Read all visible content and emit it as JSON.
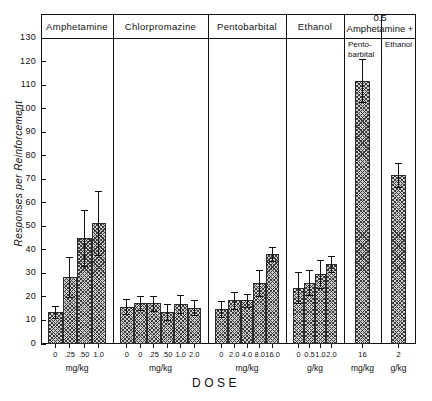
{
  "chart_data": {
    "type": "bar",
    "title": "",
    "xlabel": "DOSE",
    "ylabel": "Responses per Reinforcement",
    "ylim": [
      0,
      130
    ],
    "ytick_values": [
      0,
      10,
      20,
      30,
      40,
      50,
      60,
      70,
      80,
      90,
      100,
      110,
      120,
      130
    ],
    "ytick_labels": [
      "0",
      "10",
      "20",
      "30",
      "40",
      "50",
      "60",
      "70",
      "80",
      "90",
      "100",
      "110",
      "120",
      "130"
    ],
    "grid": false,
    "legend": "none",
    "error_bars": "vertical, symmetric, capped",
    "panels": [
      {
        "name": "amphetamine",
        "header": "Amphetamine",
        "units": "mg/kg",
        "categories": [
          "0",
          ".25",
          ".50",
          "1.0"
        ],
        "values": [
          13.5,
          28.5,
          45.0,
          51.5
        ],
        "errors": [
          2.5,
          8.5,
          12.0,
          13.5
        ]
      },
      {
        "name": "chlorpromazine",
        "header": "Chlorpromazine",
        "units": "mg/kg",
        "categories": [
          "0",
          "0",
          ".25",
          ".50",
          "1.0",
          "2.0"
        ],
        "values": [
          15.8,
          17.5,
          17.3,
          13.5,
          17.0,
          15.5
        ],
        "errors": [
          3.2,
          3.0,
          3.3,
          3.3,
          4.0,
          3.3
        ]
      },
      {
        "name": "pentobarbital",
        "header": "Pentobarbital",
        "units": "mg/kg",
        "categories": [
          "0",
          "2.0",
          "4.0",
          "8.0",
          "16.0"
        ],
        "values": [
          14.8,
          18.5,
          18.5,
          25.8,
          38.3
        ],
        "errors": [
          3.5,
          3.5,
          2.8,
          5.5,
          3.0
        ]
      },
      {
        "name": "ethanol",
        "header": "Ethanol",
        "units": "g/kg",
        "categories": [
          "0",
          "0.5",
          "1.0",
          "2.0"
        ],
        "values": [
          23.9,
          26.0,
          29.8,
          34.0
        ],
        "errors": [
          6.6,
          5.3,
          5.8,
          3.5
        ]
      },
      {
        "name": "amphetamine-plus-pentobarbital",
        "header": "Pento-\nbarbital",
        "units": "mg/kg",
        "categories": [
          "16"
        ],
        "values": [
          111.8
        ],
        "errors": [
          9.2
        ]
      },
      {
        "name": "amphetamine-plus-ethanol",
        "header": "Ethanol",
        "units": "g/kg",
        "categories": [
          "2"
        ],
        "values": [
          71.8
        ],
        "errors": [
          5.3
        ]
      }
    ],
    "combo_header": "0.5\nAmphetamine +"
  },
  "axis": {
    "y_title": "Responses per Reinforcement",
    "x_title": "DOSE"
  },
  "headers": {
    "amphetamine": "Amphetamine",
    "chlorpromazine": "Chlorpromazine",
    "pentobarbital": "Pentobarbital",
    "ethanol": "Ethanol",
    "combo_line1": "0.5",
    "combo_line2": "Amphetamine +",
    "combo_sub1_line1": "Pento-",
    "combo_sub1_line2": "barbital",
    "combo_sub2": "Ethanol"
  },
  "units": {
    "amphetamine": "mg/kg",
    "chlorpromazine": "mg/kg",
    "pentobarbital": "mg/kg",
    "ethanol": "g/kg",
    "combo_pento": "mg/kg",
    "combo_ethanol": "g/kg"
  },
  "colors": {
    "ink": "#111111",
    "bar_fill": "#cfcfcf",
    "bar_hatch": "#3a3a3a",
    "background": "#ffffff"
  }
}
